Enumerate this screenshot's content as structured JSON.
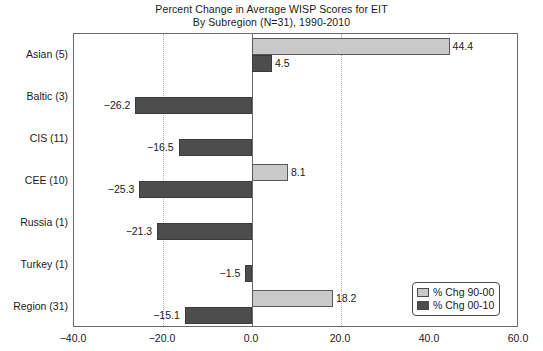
{
  "chart_data": {
    "type": "bar",
    "orientation": "horizontal",
    "title": "Percent Change in Average WISP Scores for EIT",
    "subtitle": "By Subregion (N=31), 1990-2010",
    "xlabel": "",
    "ylabel": "",
    "xlim": [
      -40.0,
      60.0
    ],
    "xticks": [
      "-40.0",
      "-20.0",
      "0.0",
      "20.0",
      "40.0",
      "60.0"
    ],
    "xtick_values": [
      -40.0,
      -20.0,
      0.0,
      20.0,
      40.0,
      60.0
    ],
    "grid": "vertical-dotted-at-minus20-and-20",
    "legend_position": "bottom-right",
    "categories": [
      "Asian (5)",
      "Baltic (3)",
      "CIS (11)",
      "CEE (10)",
      "Russia (1)",
      "Turkey (1)",
      "Region (31)"
    ],
    "series": [
      {
        "name": "% Chg 90-00",
        "color": "#c9c9c9",
        "values": [
          44.4,
          null,
          null,
          8.1,
          null,
          null,
          18.2
        ],
        "labels": [
          "44.4",
          "",
          "",
          "8.1",
          "",
          "",
          "18.2"
        ]
      },
      {
        "name": "% Chg 00-10",
        "color": "#4d4d4d",
        "values": [
          4.5,
          -26.2,
          -16.5,
          -25.3,
          -21.3,
          -1.5,
          -15.1
        ],
        "labels": [
          "4.5",
          "−26.2",
          "−16.5",
          "−25.3",
          "−21.3",
          "−1.5",
          "−15.1"
        ]
      }
    ]
  },
  "legend": {
    "items": [
      {
        "label": "% Chg 90-00",
        "swatch": "light"
      },
      {
        "label": "% Chg 00-10",
        "swatch": "dark"
      }
    ]
  },
  "colors": {
    "series_light": "#c9c9c9",
    "series_dark": "#4d4d4d",
    "axis": "#6a6a6a",
    "grid": "#b4b4b4",
    "text": "#1a1a1a",
    "background": "#ffffff"
  }
}
